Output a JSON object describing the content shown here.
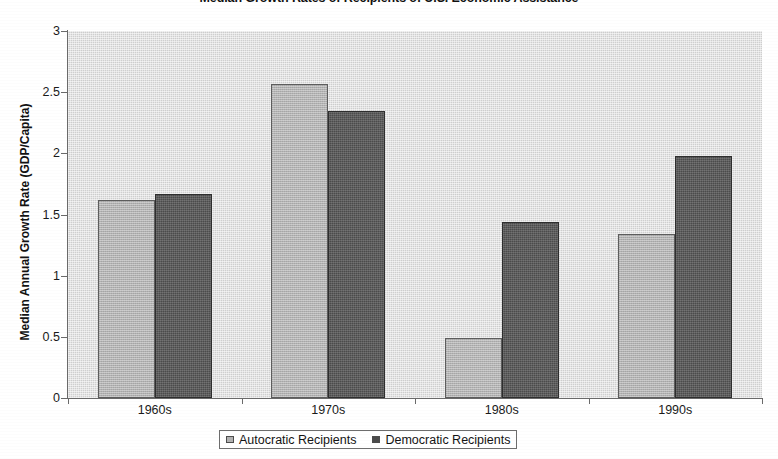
{
  "chart_data": {
    "type": "bar",
    "title": "Median Growth Rates of Recipients of U.S. Economic Assistance",
    "xlabel": "",
    "ylabel": "Median Annual Growth Rate (GDP/Capita)",
    "categories": [
      "1960s",
      "1970s",
      "1980s",
      "1990s"
    ],
    "series": [
      {
        "name": "Autocratic Recipients",
        "color": "#b2b2b2",
        "values": [
          1.62,
          2.57,
          0.49,
          1.34
        ]
      },
      {
        "name": "Democratic Recipients",
        "color": "#4b4b4b",
        "values": [
          1.67,
          2.35,
          1.44,
          1.98
        ]
      }
    ],
    "ylim": [
      0,
      3
    ],
    "yticks": [
      0,
      0.5,
      1,
      1.5,
      2,
      2.5,
      3
    ],
    "ytick_labels": [
      "0",
      "0.5",
      "1",
      "1.5",
      "2",
      "2.5",
      "3"
    ],
    "grid": false,
    "legend_position": "bottom"
  },
  "legend": {
    "items": [
      {
        "label": "Autocratic Recipients"
      },
      {
        "label": "Democratic Recipients"
      }
    ]
  }
}
